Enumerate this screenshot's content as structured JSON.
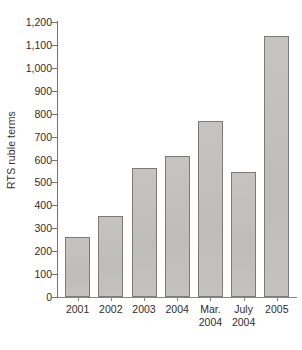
{
  "chart_data": {
    "type": "bar",
    "title": "",
    "xlabel": "",
    "ylabel": "RTS ruble terms",
    "categories": [
      "2001",
      "2002",
      "2003",
      "2004",
      "Mar.\n2004",
      "July\n2004",
      "2005"
    ],
    "values": [
      262,
      355,
      565,
      615,
      770,
      545,
      1140
    ],
    "ylim": [
      0,
      1200
    ],
    "ytick_values": [
      0,
      100,
      200,
      300,
      400,
      500,
      600,
      700,
      800,
      900,
      1000,
      1100,
      1200
    ],
    "ytick_labels": [
      "0",
      "100",
      "200",
      "300",
      "400",
      "500",
      "600",
      "700",
      "800",
      "900",
      "1,000",
      "1,100",
      "1,200"
    ],
    "grid": false,
    "legend": null,
    "colors": {
      "bar_fill": "#c3c1c0",
      "bar_edge": "#7e7a78",
      "axis": "#8a8482",
      "text": "#2f2c2b",
      "background": "#ffffff"
    }
  }
}
